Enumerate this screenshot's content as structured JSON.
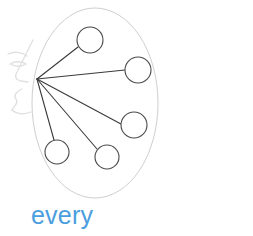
{
  "figure": {
    "kind": "quantifier-scene-diagram",
    "caption": "every",
    "caption_color": "#4a9ede",
    "background_color": "#ffffff",
    "set_boundary": {
      "shape": "ellipse",
      "center_x": 95,
      "center_y": 103,
      "radius_x": 63,
      "radius_y": 95,
      "stroke": "#cfcfcf",
      "stroke_width": 1,
      "fill": "none",
      "label": "set-boundary-ellipse"
    },
    "observer": {
      "label": "observer-face-profile",
      "stroke": "#dedede",
      "stroke_width": 1.3,
      "description": "faint left-facing profile sketch with eyebrow, eye, nose, lips and chin"
    },
    "gaze_origin": {
      "label": "gaze-origin-vertex",
      "x": 37,
      "y": 79
    },
    "gaze_lines": {
      "stroke": "#3a3a3a",
      "stroke_width": 1.1,
      "count": 5,
      "targets": [
        {
          "id": "line-to-node-1",
          "x": 78,
          "y": 47
        },
        {
          "id": "line-to-node-2",
          "x": 125,
          "y": 70
        },
        {
          "id": "line-to-node-3",
          "x": 121,
          "y": 124
        },
        {
          "id": "line-to-node-4",
          "x": 97,
          "y": 149
        },
        {
          "id": "line-to-node-5",
          "x": 54,
          "y": 140
        }
      ]
    },
    "nodes": [
      {
        "id": "node-1",
        "cx": 90,
        "cy": 40,
        "r": 13
      },
      {
        "id": "node-2",
        "cx": 138,
        "cy": 70,
        "r": 13
      },
      {
        "id": "node-3",
        "cx": 134,
        "cy": 125,
        "r": 13
      },
      {
        "id": "node-4",
        "cx": 107,
        "cy": 157,
        "r": 12
      },
      {
        "id": "node-5",
        "cx": 57,
        "cy": 152,
        "r": 12
      }
    ],
    "node_style": {
      "stroke": "#4a4a4a",
      "stroke_width": 1.1,
      "fill": "#ffffff"
    }
  }
}
